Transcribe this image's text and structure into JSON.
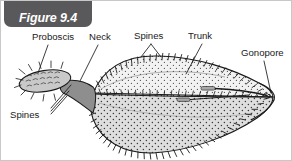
{
  "figure": {
    "badge_label": "Figure 9.4",
    "badge_color": "#59595b",
    "badge_text_color": "#ffffff",
    "background_color": "#ffffff",
    "border_color": "#c8c8c8",
    "line_color": "#1a1a1a",
    "label_text_color": "#1a1a1a"
  },
  "labels": [
    {
      "id": "proboscis",
      "text": "Proboscis",
      "x": 31,
      "y": 31
    },
    {
      "id": "neck",
      "text": "Neck",
      "x": 88,
      "y": 31
    },
    {
      "id": "spines_top",
      "text": "Spines",
      "x": 133,
      "y": 30
    },
    {
      "id": "trunk",
      "text": "Trunk",
      "x": 187,
      "y": 30
    },
    {
      "id": "gonopore",
      "text": "Gonopore",
      "x": 240,
      "y": 47
    },
    {
      "id": "spines_left",
      "text": "Spines",
      "x": 9,
      "y": 109
    }
  ],
  "anatomy": {
    "proboscis": {
      "fill": "#c9c9c9",
      "description": "oval anterior organ bearing rows of recurved hooks"
    },
    "neck": {
      "fill": "#8e8e8e",
      "description": "darker grey wedge joining proboscis to trunk"
    },
    "trunk": {
      "fill": "#d5d5d5",
      "description": "large stippled leaf-shaped body with marginal spine rows"
    },
    "gonopore": {
      "description": "posterior genital opening at the tapered tail tip"
    },
    "internal_organs": {
      "fill": "#b0b0b0",
      "description": "elongate internal structures with duct running to the gonopore"
    }
  }
}
